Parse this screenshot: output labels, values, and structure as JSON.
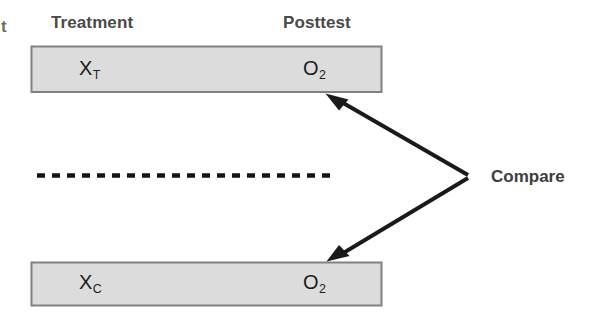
{
  "diagram": {
    "type": "posttest-only-control-group-design",
    "background_color": "#ffffff",
    "clipped_left_text": "t",
    "headers": {
      "treatment": "Treatment",
      "posttest": "Posttest"
    },
    "groups": [
      {
        "id": "treatment-group",
        "treatment_symbol": "X",
        "treatment_subscript": "T",
        "posttest_symbol": "O",
        "posttest_subscript": "2"
      },
      {
        "id": "control-group",
        "treatment_symbol": "X",
        "treatment_subscript": "C",
        "posttest_symbol": "O",
        "posttest_subscript": "2"
      }
    ],
    "annotation": {
      "compare_label": "Compare"
    },
    "separator": {
      "style": "dashed",
      "meaning": "nonequivalent-groups-divider"
    },
    "colors": {
      "box_fill": "#dcdcdc",
      "box_border": "#818181",
      "arrow": "#1a1a1a",
      "header_text": "#4a4a4a",
      "cell_text": "#1d1d1d",
      "compare_text": "#3d3d3d",
      "dash_line": "#151515"
    }
  }
}
